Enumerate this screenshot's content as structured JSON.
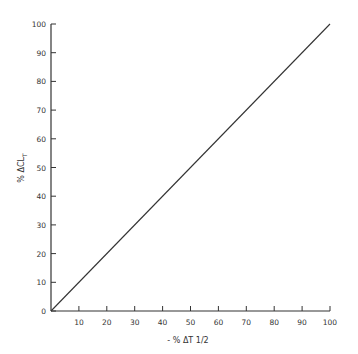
{
  "chart_data": {
    "type": "line",
    "title": "",
    "xlabel": "- % ΔT 1/2",
    "ylabel": "% ΔCL_T",
    "xlim": [
      0,
      100
    ],
    "ylim": [
      0,
      100
    ],
    "x_ticks": [
      10,
      20,
      30,
      40,
      50,
      60,
      70,
      80,
      90,
      100
    ],
    "y_ticks": [
      0,
      10,
      20,
      30,
      40,
      50,
      60,
      70,
      80,
      90,
      100
    ],
    "grid": false,
    "legend": null,
    "series": [
      {
        "name": "line",
        "x": [
          0,
          100
        ],
        "y": [
          0,
          100
        ]
      }
    ]
  },
  "labels": {
    "x_axis": "- % ΔT 1/2",
    "y_axis_main": "% ΔCL",
    "y_axis_sub": "T"
  },
  "x_tick_labels": [
    "10",
    "20",
    "30",
    "40",
    "50",
    "60",
    "70",
    "80",
    "90",
    "100"
  ],
  "y_tick_labels": [
    "0",
    "10",
    "20",
    "30",
    "40",
    "50",
    "60",
    "70",
    "80",
    "90",
    "100"
  ],
  "colors": {
    "ink": "#333333"
  }
}
